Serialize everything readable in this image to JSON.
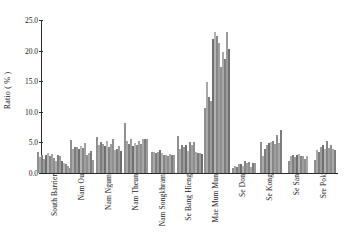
{
  "chart_data": {
    "type": "bar",
    "title": "",
    "xlabel": "",
    "ylabel": "Ratio ( % )",
    "ylim": [
      0.0,
      25.0
    ],
    "yticks": [
      0.0,
      5.0,
      10.0,
      15.0,
      20.0,
      25.0
    ],
    "ytick_labels": [
      "0.0",
      "5.0",
      "10.0",
      "15.0",
      "20.0",
      "25.0"
    ],
    "grid": false,
    "legend": "none",
    "categories": [
      "South Barrier",
      "Nam Ou",
      "Nam Ngum",
      "Nam Theun",
      "Nam Songkhram",
      "Se Bang Hieng",
      "Mae Mum Mun",
      "Se Don",
      "Se Kong",
      "Se San",
      "Sre Pok"
    ],
    "groups": [
      {
        "category": "South Barrier",
        "values": [
          3.5,
          2.6,
          3.0,
          2.3,
          2.9,
          3.2,
          2.8,
          3.1,
          2.4,
          2.0,
          2.9,
          2.7,
          1.9,
          1.6,
          1.4,
          1.1,
          0.9,
          0.9
        ]
      },
      {
        "category": "Nam Ou",
        "values": [
          5.4,
          4.0,
          4.3,
          4.2,
          3.9,
          4.4,
          4.1,
          4.9,
          3.0,
          3.3,
          3.6,
          2.2
        ]
      },
      {
        "category": "Nam Ngum",
        "values": [
          5.9,
          4.6,
          5.1,
          4.8,
          4.4,
          5.3,
          4.2,
          4.7,
          5.6,
          3.7,
          4.0,
          4.4,
          3.6
        ]
      },
      {
        "category": "Nam Theun",
        "values": [
          8.1,
          5.3,
          4.7,
          5.5,
          4.4,
          4.9,
          4.6,
          5.2,
          4.8,
          5.6,
          5.5,
          5.5
        ]
      },
      {
        "category": "Nam Songkhram",
        "values": [
          3.5,
          3.4,
          3.3,
          3.5,
          3.8,
          3.2,
          2.9,
          3.0,
          2.7,
          3.1,
          2.9,
          2.9
        ]
      },
      {
        "category": "Se Bang Hieng",
        "values": [
          6.0,
          4.0,
          4.5,
          4.3,
          4.6,
          3.6,
          5.1,
          4.6,
          5.0,
          3.4,
          3.3,
          3.2,
          3.1
        ]
      },
      {
        "category": "Mae Mum Mun",
        "values": [
          10.7,
          14.8,
          12.4,
          11.8,
          21.9,
          23.1,
          22.4,
          21.3,
          17.3,
          19.7,
          18.6,
          23.1,
          20.3
        ]
      },
      {
        "category": "Se Don",
        "values": [
          0.9,
          1.1,
          1.0,
          1.5,
          1.4,
          1.1,
          1.9,
          1.6,
          1.8,
          1.0,
          1.7,
          1.7
        ]
      },
      {
        "category": "Se Kong",
        "values": [
          5.0,
          2.7,
          4.0,
          4.6,
          4.9,
          5.1,
          5.3,
          4.8,
          6.2,
          4.9,
          7.1
        ]
      },
      {
        "category": "Se San",
        "values": [
          1.9,
          2.8,
          3.0,
          2.6,
          2.9,
          3.1,
          2.8,
          2.7,
          2.3,
          2.7
        ]
      },
      {
        "category": "Sre Pok",
        "values": [
          2.2,
          3.7,
          3.5,
          4.3,
          4.6,
          4.0,
          5.3,
          4.1,
          4.5,
          3.9,
          3.8
        ]
      }
    ],
    "bar_colors": [
      "#8f8f8f",
      "#a8a8a8",
      "#7d7d7d",
      "#9b9b9b",
      "#6f6f6f",
      "#b4b4b4",
      "#868686",
      "#9f9f9f"
    ]
  }
}
